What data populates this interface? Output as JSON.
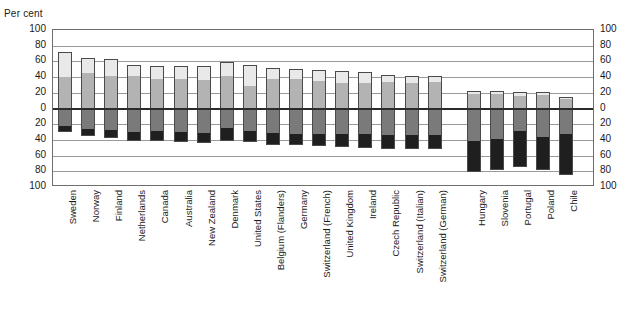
{
  "chart_data": {
    "type": "bar",
    "subtype": "diverging-stacked-bar",
    "title": "",
    "subtitle": "",
    "xlabel": "",
    "ylabel": "Per cent",
    "axis_unit_caption": "Per cent",
    "ylim": [
      -100,
      100
    ],
    "y_ticks_up": [
      0,
      20,
      40,
      60,
      80,
      100
    ],
    "y_ticks_down": [
      0,
      20,
      40,
      60,
      80,
      100
    ],
    "y_tick_labels_top_to_bottom": [
      "100",
      "80",
      "60",
      "40",
      "20",
      "0",
      "20",
      "40",
      "60",
      "80",
      "100"
    ],
    "grid": true,
    "legend_position": "none",
    "zero_line": 0,
    "categories": [
      "Sweden",
      "Norway",
      "Finland",
      "Netherlands",
      "Canada",
      "Australia",
      "New Zealand",
      "Denmark",
      "United States",
      "Belgium (Flanders)",
      "Germany",
      "Switzerland (French)",
      "United Kingdom",
      "Ireland",
      "Czech Republic",
      "Switzerland (Italian)",
      "Switzerland (German)",
      "Hungary",
      "Slovenia",
      "Portugal",
      "Poland",
      "Chile"
    ],
    "group_break_after_index": 16,
    "series": [
      {
        "name": "upper-light",
        "direction": "up",
        "color": "#e9e9e9",
        "values": [
          32,
          19,
          22,
          14,
          16,
          17,
          18,
          17,
          26,
          14,
          13,
          14,
          15,
          14,
          9,
          10,
          8,
          4,
          4,
          5,
          4,
          3
        ]
      },
      {
        "name": "upper-mid",
        "direction": "up",
        "color": "#b3b3b3",
        "values": [
          40,
          45,
          41,
          41,
          38,
          37,
          36,
          42,
          29,
          38,
          37,
          35,
          33,
          32,
          34,
          32,
          34,
          18,
          18,
          16,
          17,
          12
        ]
      },
      {
        "name": "lower-mid",
        "direction": "down",
        "color": "#7a7a7a",
        "values": [
          22,
          26,
          27,
          30,
          29,
          30,
          31,
          25,
          29,
          31,
          32,
          33,
          32,
          33,
          34,
          34,
          34,
          41,
          39,
          29,
          36,
          32
        ]
      },
      {
        "name": "lower-dark",
        "direction": "down",
        "color": "#1f1f1f",
        "values": [
          8,
          9,
          10,
          12,
          13,
          13,
          13,
          16,
          14,
          15,
          15,
          15,
          17,
          17,
          18,
          17,
          18,
          40,
          39,
          45,
          42,
          53
        ]
      }
    ]
  }
}
